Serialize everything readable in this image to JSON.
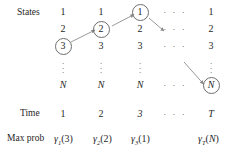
{
  "diagram": {
    "row_labels": {
      "states": "States",
      "time": "Time",
      "max_prob": "Max prob"
    },
    "state_rows": [
      "1",
      "2",
      "3",
      "⋮",
      "N"
    ],
    "ellipsis": "· · ·",
    "columns": [
      {
        "time": "1",
        "states": [
          "1",
          "2",
          "3",
          "⋮",
          "N"
        ],
        "highlighted_state": "3",
        "gamma": {
          "symbol": "γ",
          "subscript": "1",
          "arg": "3",
          "text": "γ1(3)"
        }
      },
      {
        "time": "2",
        "states": [
          "1",
          "2",
          "3",
          "⋮",
          "N"
        ],
        "highlighted_state": "2",
        "gamma": {
          "symbol": "γ",
          "subscript": "2",
          "arg": "2",
          "text": "γ2(2)"
        }
      },
      {
        "time": "3",
        "states": [
          "1",
          "2",
          "3",
          "⋮",
          "N"
        ],
        "highlighted_state": "1",
        "gamma": {
          "symbol": "γ",
          "subscript": "3",
          "arg": "1",
          "text": "γ3(1)"
        }
      },
      {
        "time": "· · ·",
        "states": [
          "· · ·",
          "· · ·",
          "· · ·",
          "",
          "· · ·"
        ],
        "highlighted_state": null,
        "gamma": {
          "symbol": "",
          "subscript": "",
          "arg": "",
          "text": ""
        }
      },
      {
        "time": "T",
        "states": [
          "1",
          "2",
          "3",
          "⋮",
          "N"
        ],
        "highlighted_state": "N",
        "gamma": {
          "symbol": "γ",
          "subscript": "T",
          "arg": "N",
          "text": "γT(N)"
        }
      }
    ],
    "colors": {
      "ink": "#1f1f1f",
      "circle_stroke": "#6e6e6e",
      "arrow_stroke": "#8a8a8a",
      "background": "#ffffff"
    }
  }
}
